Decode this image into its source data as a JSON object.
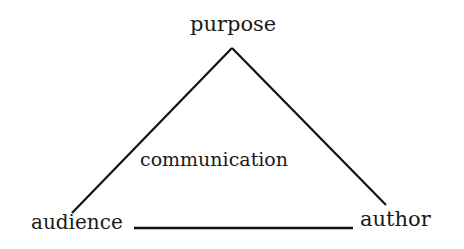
{
  "diagram": {
    "type": "triangle",
    "nodes": {
      "top": "purpose",
      "bottom_left": "audience",
      "bottom_right": "author"
    },
    "center_label": "communication",
    "edges": [
      {
        "from": "purpose",
        "to": "audience"
      },
      {
        "from": "purpose",
        "to": "author"
      },
      {
        "from": "audience",
        "to": "author"
      }
    ],
    "line_color": "#111111",
    "text_color": "#1a1a1a"
  }
}
